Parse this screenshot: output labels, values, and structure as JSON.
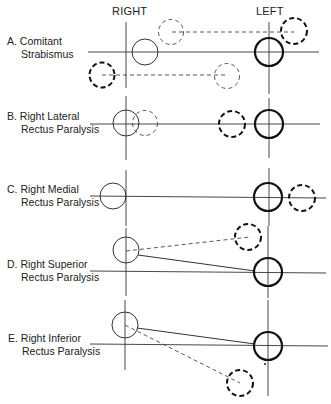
{
  "headers": {
    "right": "RIGHT",
    "left": "LEFT"
  },
  "panels": [
    {
      "id": "A",
      "line1": "A. Comitant",
      "line2": "Strabismus"
    },
    {
      "id": "B",
      "line1": "B. Right Lateral",
      "line2": "Rectus Paralysis"
    },
    {
      "id": "C",
      "line1": "C. Right Medial",
      "line2": "Rectus Paralysis"
    },
    {
      "id": "D",
      "line1": "D. Right Superior",
      "line2": "Rectus Paralysis"
    },
    {
      "id": "E",
      "line1": "E. Right Inferior",
      "line2": "Rectus Paralysis"
    }
  ],
  "legend_semantics": {
    "thin_solid_circle": "right eye",
    "thick_solid_circle": "left eye",
    "dashed_circle": "deviated/projected image position"
  }
}
